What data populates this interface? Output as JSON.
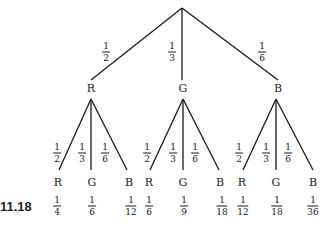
{
  "caption": "11.18",
  "root": {
    "x": 182,
    "y": 8
  },
  "level1": [
    {
      "label": "R",
      "prob": {
        "num": "1",
        "den": "2"
      },
      "node": {
        "x": 91,
        "y": 88
      },
      "end": {
        "x": 91,
        "y": 80
      },
      "prob_pos": {
        "x": 106,
        "y": 52
      },
      "sub_top": {
        "x": 91,
        "y": 99
      }
    },
    {
      "label": "G",
      "prob": {
        "num": "1",
        "den": "3"
      },
      "node": {
        "x": 183,
        "y": 88
      },
      "end": {
        "x": 182,
        "y": 80
      },
      "prob_pos": {
        "x": 172,
        "y": 52
      },
      "sub_top": {
        "x": 183,
        "y": 99
      }
    },
    {
      "label": "B",
      "prob": {
        "num": "1",
        "den": "6"
      },
      "node": {
        "x": 278,
        "y": 88
      },
      "end": {
        "x": 278,
        "y": 80
      },
      "prob_pos": {
        "x": 262,
        "y": 52
      },
      "sub_top": {
        "x": 276,
        "y": 99
      }
    }
  ],
  "level2": [
    {
      "parent": 0,
      "label": "R",
      "prob": {
        "num": "1",
        "den": "2"
      },
      "end": {
        "x": 59,
        "y": 170
      },
      "prob_pos": {
        "x": 57,
        "y": 153
      },
      "leaf_pos": {
        "x": 58,
        "y": 182
      },
      "joint": {
        "num": "1",
        "den": "4"
      },
      "joint_pos": {
        "x": 57,
        "y": 206
      }
    },
    {
      "parent": 0,
      "label": "G",
      "prob": {
        "num": "1",
        "den": "3"
      },
      "end": {
        "x": 91,
        "y": 170
      },
      "prob_pos": {
        "x": 82,
        "y": 153
      },
      "leaf_pos": {
        "x": 92,
        "y": 182
      },
      "joint": {
        "num": "1",
        "den": "6"
      },
      "joint_pos": {
        "x": 92,
        "y": 206
      }
    },
    {
      "parent": 0,
      "label": "B",
      "prob": {
        "num": "1",
        "den": "6"
      },
      "end": {
        "x": 127,
        "y": 170
      },
      "prob_pos": {
        "x": 105,
        "y": 153
      },
      "leaf_pos": {
        "x": 129,
        "y": 182
      },
      "joint": {
        "num": "1",
        "den": "12"
      },
      "joint_pos": {
        "x": 131,
        "y": 206
      }
    },
    {
      "parent": 1,
      "label": "R",
      "prob": {
        "num": "1",
        "den": "2"
      },
      "end": {
        "x": 150,
        "y": 170
      },
      "prob_pos": {
        "x": 147,
        "y": 153
      },
      "leaf_pos": {
        "x": 149,
        "y": 182
      },
      "joint": {
        "num": "1",
        "den": "6"
      },
      "joint_pos": {
        "x": 149,
        "y": 206
      }
    },
    {
      "parent": 1,
      "label": "G",
      "prob": {
        "num": "1",
        "den": "3"
      },
      "end": {
        "x": 183,
        "y": 170
      },
      "prob_pos": {
        "x": 173,
        "y": 153
      },
      "leaf_pos": {
        "x": 183,
        "y": 182
      },
      "joint": {
        "num": "1",
        "den": "9"
      },
      "joint_pos": {
        "x": 184,
        "y": 206
      }
    },
    {
      "parent": 1,
      "label": "B",
      "prob": {
        "num": "1",
        "den": "6"
      },
      "end": {
        "x": 219,
        "y": 170
      },
      "prob_pos": {
        "x": 195,
        "y": 153
      },
      "leaf_pos": {
        "x": 220,
        "y": 182
      },
      "joint": {
        "num": "1",
        "den": "18"
      },
      "joint_pos": {
        "x": 222,
        "y": 206
      }
    },
    {
      "parent": 2,
      "label": "R",
      "prob": {
        "num": "1",
        "den": "2"
      },
      "end": {
        "x": 243,
        "y": 170
      },
      "prob_pos": {
        "x": 239,
        "y": 153
      },
      "leaf_pos": {
        "x": 242,
        "y": 182
      },
      "joint": {
        "num": "1",
        "den": "12"
      },
      "joint_pos": {
        "x": 243,
        "y": 206
      }
    },
    {
      "parent": 2,
      "label": "G",
      "prob": {
        "num": "1",
        "den": "3"
      },
      "end": {
        "x": 276,
        "y": 170
      },
      "prob_pos": {
        "x": 266,
        "y": 153
      },
      "leaf_pos": {
        "x": 276,
        "y": 182
      },
      "joint": {
        "num": "1",
        "den": "18"
      },
      "joint_pos": {
        "x": 277,
        "y": 206
      }
    },
    {
      "parent": 2,
      "label": "B",
      "prob": {
        "num": "1",
        "den": "6"
      },
      "end": {
        "x": 313,
        "y": 170
      },
      "prob_pos": {
        "x": 288,
        "y": 153
      },
      "leaf_pos": {
        "x": 313,
        "y": 182
      },
      "joint": {
        "num": "1",
        "den": "36"
      },
      "joint_pos": {
        "x": 313,
        "y": 206
      }
    }
  ]
}
